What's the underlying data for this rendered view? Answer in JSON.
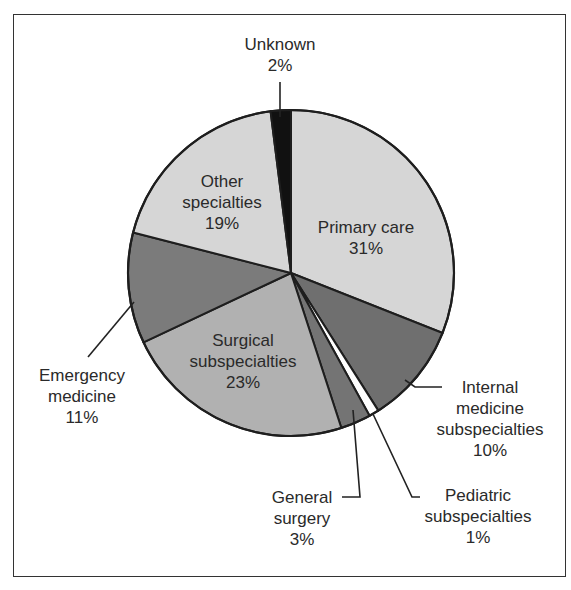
{
  "chart_data": {
    "type": "pie",
    "title": "",
    "start_angle_deg": 0,
    "direction": "clockwise",
    "slices": [
      {
        "label": "Primary care",
        "value": 31,
        "pct_label": "31%",
        "color": "#d6d6d6"
      },
      {
        "label": "Internal medicine subspecialties",
        "value": 10,
        "pct_label": "10%",
        "color": "#6f6f6f"
      },
      {
        "label": "Pediatric subspecialties",
        "value": 1,
        "pct_label": "1%",
        "color": "#ffffff"
      },
      {
        "label": "General surgery",
        "value": 3,
        "pct_label": "3%",
        "color": "#747474"
      },
      {
        "label": "Surgical subspecialties",
        "value": 23,
        "pct_label": "23%",
        "color": "#b1b1b1"
      },
      {
        "label": "Emergency medicine",
        "value": 11,
        "pct_label": "11%",
        "color": "#7b7b7b"
      },
      {
        "label": "Other specialties",
        "value": 19,
        "pct_label": "19%",
        "color": "#d6d6d6"
      },
      {
        "label": "Unknown",
        "value": 2,
        "pct_label": "2%",
        "color": "#111111"
      }
    ],
    "legend": "none (labels placed on/next to slices)"
  },
  "labels": {
    "unknown": {
      "lines": [
        "Unknown",
        "2%"
      ]
    },
    "other": {
      "lines": [
        "Other",
        "specialties",
        "19%"
      ]
    },
    "primary": {
      "lines": [
        "Primary care",
        "31%"
      ]
    },
    "surgical": {
      "lines": [
        "Surgical",
        "subspecialties",
        "23%"
      ]
    },
    "emergency": {
      "lines": [
        "Emergency",
        "medicine",
        "11%"
      ]
    },
    "internal": {
      "lines": [
        "Internal",
        "medicine",
        "subspecialties",
        "10%"
      ]
    },
    "general": {
      "lines": [
        "General",
        "surgery",
        "3%"
      ]
    },
    "pediatric": {
      "lines": [
        "Pediatric",
        "subspecialties",
        "1%"
      ]
    }
  }
}
